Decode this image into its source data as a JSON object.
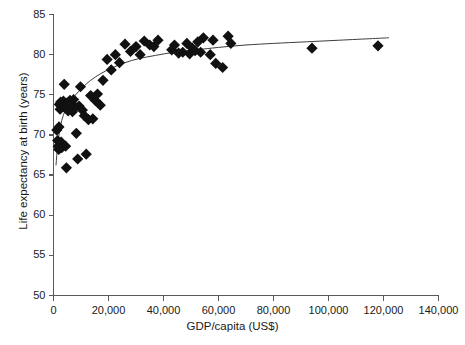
{
  "chart_data": {
    "type": "scatter",
    "title": "",
    "xlabel": "GDP/capita (US$)",
    "ylabel": "Life expectancy at birth (years)",
    "xlim": [
      0,
      140000
    ],
    "ylim": [
      50,
      85
    ],
    "xticks": [
      0,
      20000,
      40000,
      60000,
      80000,
      100000,
      120000,
      140000
    ],
    "xtick_labels": [
      "0",
      "20,000",
      "40,000",
      "60,000",
      "80,000",
      "100,000",
      "120,000",
      "140,000"
    ],
    "yticks": [
      50,
      55,
      60,
      65,
      70,
      75,
      80,
      85
    ],
    "ytick_labels": [
      "50",
      "55",
      "60",
      "65",
      "70",
      "75",
      "80",
      "85"
    ],
    "grid": false,
    "legend": false,
    "marker": "diamond",
    "marker_color": "#111111",
    "marker_size": 8,
    "series": [
      {
        "name": "Countries",
        "points": [
          [
            1200,
            70.6
          ],
          [
            1500,
            69.3
          ],
          [
            1700,
            68.6
          ],
          [
            1900,
            68.2
          ],
          [
            2000,
            71.0
          ],
          [
            2100,
            73.8
          ],
          [
            2400,
            73.2
          ],
          [
            2600,
            74.1
          ],
          [
            2800,
            69.1
          ],
          [
            3000,
            68.4
          ],
          [
            3300,
            73.6
          ],
          [
            3600,
            74.2
          ],
          [
            3900,
            76.3
          ],
          [
            4200,
            73.4
          ],
          [
            4400,
            68.6
          ],
          [
            4700,
            65.9
          ],
          [
            5000,
            74.0
          ],
          [
            5300,
            73.0
          ],
          [
            5600,
            73.9
          ],
          [
            6000,
            74.3
          ],
          [
            6400,
            73.3
          ],
          [
            6900,
            72.9
          ],
          [
            7300,
            74.4
          ],
          [
            7800,
            73.5
          ],
          [
            8300,
            70.2
          ],
          [
            8800,
            67.0
          ],
          [
            9300,
            73.6
          ],
          [
            9800,
            76.0
          ],
          [
            10500,
            73.1
          ],
          [
            11200,
            72.4
          ],
          [
            11900,
            67.6
          ],
          [
            12700,
            71.9
          ],
          [
            13500,
            74.9
          ],
          [
            14300,
            72.0
          ],
          [
            15200,
            74.3
          ],
          [
            16000,
            75.1
          ],
          [
            17000,
            73.7
          ],
          [
            18000,
            76.8
          ],
          [
            19500,
            79.4
          ],
          [
            21000,
            78.1
          ],
          [
            22500,
            80.0
          ],
          [
            24000,
            79.0
          ],
          [
            26000,
            81.3
          ],
          [
            28000,
            80.4
          ],
          [
            30000,
            81.0
          ],
          [
            31500,
            80.0
          ],
          [
            33000,
            81.7
          ],
          [
            35000,
            81.2
          ],
          [
            36500,
            81.0
          ],
          [
            38000,
            81.8
          ],
          [
            43000,
            80.6
          ],
          [
            44000,
            81.2
          ],
          [
            45500,
            80.2
          ],
          [
            47000,
            80.3
          ],
          [
            48500,
            81.4
          ],
          [
            49500,
            80.1
          ],
          [
            50500,
            80.8
          ],
          [
            51500,
            80.5
          ],
          [
            52500,
            81.6
          ],
          [
            53500,
            80.3
          ],
          [
            54500,
            82.1
          ],
          [
            57000,
            80.0
          ],
          [
            58000,
            81.8
          ],
          [
            59000,
            78.9
          ],
          [
            61500,
            78.4
          ],
          [
            63500,
            82.3
          ],
          [
            64500,
            81.4
          ],
          [
            94000,
            80.8
          ],
          [
            118000,
            81.1
          ]
        ]
      }
    ],
    "fit_curve": {
      "name": "Logarithmic fit",
      "points": [
        [
          900,
          66.2
        ],
        [
          1400,
          68.3
        ],
        [
          2100,
          70.3
        ],
        [
          3000,
          71.8
        ],
        [
          4200,
          73.0
        ],
        [
          5800,
          74.0
        ],
        [
          7800,
          74.9
        ],
        [
          10500,
          75.9
        ],
        [
          13500,
          76.8
        ],
        [
          17000,
          77.6
        ],
        [
          21000,
          78.3
        ],
        [
          26000,
          79.0
        ],
        [
          31000,
          79.5
        ],
        [
          37000,
          79.9
        ],
        [
          44000,
          80.3
        ],
        [
          52000,
          80.6
        ],
        [
          60000,
          80.9
        ],
        [
          70000,
          81.2
        ],
        [
          80000,
          81.4
        ],
        [
          92000,
          81.6
        ],
        [
          104000,
          81.8
        ],
        [
          116000,
          82.0
        ],
        [
          122000,
          82.1
        ]
      ],
      "color": "#3d3d3d",
      "width": 1
    }
  },
  "axes": {
    "axis_color": "#5a5a5a",
    "axis_width": 1.2,
    "tick_length": 5
  }
}
